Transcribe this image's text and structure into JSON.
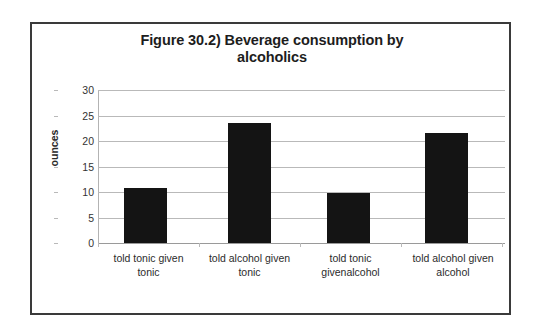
{
  "figure": {
    "title_line1": "Figure 30.2) Beverage consumption by",
    "title_line2": "alcoholics",
    "frame_color": "#3a3a3a",
    "background": "#ffffff"
  },
  "chart_data": {
    "type": "bar",
    "title": "Figure 30.2) Beverage consumption by alcoholics",
    "xlabel": "",
    "ylabel": "ounces",
    "categories": [
      "told tonic given tonic",
      "told alcohol given tonic",
      "told tonic givenalcohol",
      "told alcohol given alcohol"
    ],
    "category_lines": [
      [
        "told tonic given",
        "tonic"
      ],
      [
        "told alcohol given",
        "tonic"
      ],
      [
        "told tonic",
        "givenalcohol"
      ],
      [
        "told alcohol given",
        "alcohol"
      ]
    ],
    "values": [
      10.8,
      23.6,
      9.9,
      21.6
    ],
    "ylim": [
      0,
      30
    ],
    "yticks": [
      0,
      5,
      10,
      15,
      20,
      25,
      30
    ],
    "ytick_labels": [
      "0",
      "5",
      "10",
      "15",
      "20",
      "25",
      "30"
    ],
    "grid": "horizontal",
    "legend": "none",
    "bar_color": "#141414",
    "gridline_color": "#b9b9b9"
  }
}
